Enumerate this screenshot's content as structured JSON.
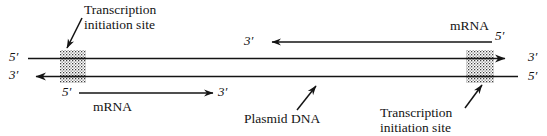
{
  "figure": {
    "type": "diagram",
    "background_color": "#ffffff",
    "line_color": "#141414",
    "stipple_color": "#4a4a4a"
  },
  "labels": {
    "transcription_initiation_top": "Transcription\ninitiation site",
    "transcription_initiation_bottom": "Transcription\ninitiation site",
    "plasmid_dna": "Plasmid DNA",
    "mrna_top": "mRNA",
    "mrna_bottom": "mRNA",
    "five_prime_left_top": "5′",
    "three_prime_left_bottom": "3′",
    "three_prime_right_top": "3′",
    "five_prime_right_bottom": "5′",
    "three_prime_mid_top": "3′",
    "five_prime_mrna_top": "5′",
    "five_prime_mrna_bottom": "5′",
    "three_prime_mrna_bottom": "3′"
  },
  "strands": {
    "top": {
      "name": "top-dna-strand",
      "left_end_label": "5′",
      "right_end_label": "3′",
      "arrow_direction": "right"
    },
    "bottom": {
      "name": "bottom-dna-strand",
      "left_end_label": "3′",
      "right_end_label": "5′",
      "arrow_direction": "left"
    }
  },
  "transcripts": [
    {
      "name": "upper-mrna-transcript",
      "label": "mRNA",
      "start_label": "5′",
      "end_label": "3′",
      "direction": "leftward"
    },
    {
      "name": "lower-mrna-transcript",
      "label": "mRNA",
      "start_label": "5′",
      "end_label": "3′",
      "direction": "rightward"
    }
  ],
  "initiation_sites": [
    {
      "name": "left-initiation-site",
      "caption": "Transcription initiation site"
    },
    {
      "name": "right-initiation-site",
      "caption": "Transcription initiation site"
    }
  ]
}
